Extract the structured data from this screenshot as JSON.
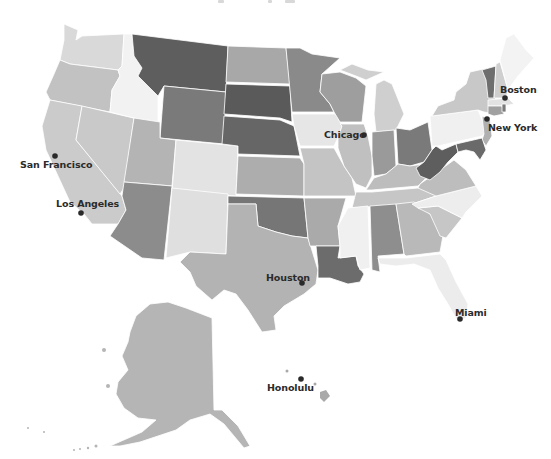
{
  "map": {
    "type": "choropleth",
    "region": "United States",
    "color_scheme": "grayscale",
    "background": "#ffffff",
    "shades": {
      "darkest": "#5e5e5e",
      "dark": "#717171",
      "medium_dark": "#888888",
      "medium": "#a3a3a3",
      "light": "#bdbdbd",
      "lighter": "#d6d6d6",
      "lightest": "#efefef"
    }
  },
  "cities": [
    {
      "name": "Boston",
      "dot": [
        505,
        98
      ],
      "label": [
        500,
        84
      ]
    },
    {
      "name": "New York",
      "dot": [
        487,
        119
      ],
      "label": [
        488,
        121
      ]
    },
    {
      "name": "Chicago",
      "dot": [
        364,
        135
      ],
      "label": [
        324,
        128
      ]
    },
    {
      "name": "San Francisco",
      "dot": [
        55,
        156
      ],
      "label": [
        20,
        158
      ]
    },
    {
      "name": "Los Angeles",
      "dot": [
        81,
        213
      ],
      "label": [
        56,
        198
      ]
    },
    {
      "name": "Houston",
      "dot": [
        302,
        283
      ],
      "label": [
        266,
        272
      ]
    },
    {
      "name": "Miami",
      "dot": [
        460,
        319
      ],
      "label": [
        455,
        308
      ]
    },
    {
      "name": "Honolulu",
      "dot": [
        300,
        379
      ],
      "label": [
        267,
        382
      ]
    }
  ]
}
